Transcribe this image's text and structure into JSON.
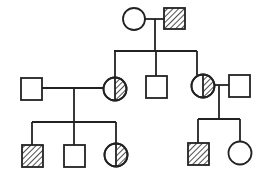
{
  "diagram": {
    "type": "pedigree",
    "colors": {
      "line": "#222222",
      "background": "#ffffff"
    },
    "legend": {
      "square": "male",
      "circle": "female",
      "hatched": "affected",
      "half_hatched": "carrier",
      "open": "unaffected"
    },
    "generations": [
      {
        "id": "I",
        "individuals": [
          {
            "id": "I-1",
            "sex": "female",
            "status": "unaffected"
          },
          {
            "id": "I-2",
            "sex": "male",
            "status": "affected"
          }
        ]
      },
      {
        "id": "II",
        "individuals": [
          {
            "id": "II-spouse-1",
            "sex": "male",
            "status": "unaffected",
            "married_in": true
          },
          {
            "id": "II-1",
            "sex": "female",
            "status": "carrier"
          },
          {
            "id": "II-2",
            "sex": "male",
            "status": "unaffected"
          },
          {
            "id": "II-3",
            "sex": "female",
            "status": "carrier"
          },
          {
            "id": "II-spouse-2",
            "sex": "male",
            "status": "unaffected",
            "married_in": true
          }
        ]
      },
      {
        "id": "III",
        "individuals": [
          {
            "id": "III-1",
            "sex": "male",
            "status": "affected",
            "parents": [
              "II-spouse-1",
              "II-1"
            ]
          },
          {
            "id": "III-2",
            "sex": "male",
            "status": "unaffected",
            "parents": [
              "II-spouse-1",
              "II-1"
            ]
          },
          {
            "id": "III-3",
            "sex": "female",
            "status": "carrier",
            "parents": [
              "II-spouse-1",
              "II-1"
            ]
          },
          {
            "id": "III-4",
            "sex": "male",
            "status": "affected",
            "parents": [
              "II-3",
              "II-spouse-2"
            ]
          },
          {
            "id": "III-5",
            "sex": "female",
            "status": "unaffected",
            "parents": [
              "II-3",
              "II-spouse-2"
            ]
          }
        ]
      }
    ]
  }
}
